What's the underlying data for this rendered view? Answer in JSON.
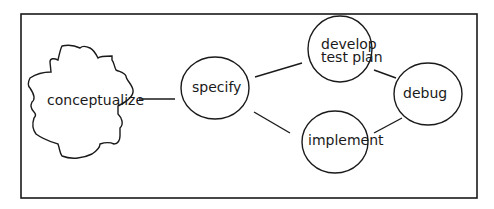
{
  "diagram": {
    "nodes": [
      {
        "id": "conceptualize",
        "label": "conceptualize",
        "shape": "cloud"
      },
      {
        "id": "specify",
        "label": "specify",
        "shape": "circle"
      },
      {
        "id": "develop",
        "label_line1": "develop",
        "label_line2": "test plan",
        "shape": "circle"
      },
      {
        "id": "debug",
        "label": "debug",
        "shape": "circle"
      },
      {
        "id": "implement",
        "label": "implement",
        "shape": "circle"
      }
    ],
    "edges": [
      {
        "from": "conceptualize",
        "to": "specify"
      },
      {
        "from": "specify",
        "to": "develop"
      },
      {
        "from": "specify",
        "to": "implement"
      },
      {
        "from": "develop",
        "to": "debug"
      },
      {
        "from": "implement",
        "to": "debug"
      }
    ],
    "stroke_color": "#1a1a1a"
  }
}
